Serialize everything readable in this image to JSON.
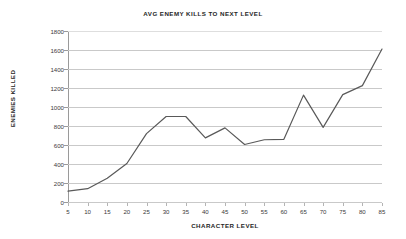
{
  "chart_data": {
    "type": "line",
    "title": "AVG ENEMY KILLS TO NEXT LEVEL",
    "xlabel": "CHARACTER LEVEL",
    "ylabel": "ENEMIES KILLED",
    "x": [
      5,
      10,
      15,
      20,
      25,
      30,
      35,
      40,
      45,
      50,
      55,
      60,
      65,
      70,
      75,
      80,
      85
    ],
    "categories": [
      "5",
      "10",
      "15",
      "20",
      "25",
      "30",
      "35",
      "40",
      "45",
      "50",
      "55",
      "60",
      "65",
      "70",
      "75",
      "80",
      "85"
    ],
    "values": [
      115,
      140,
      250,
      405,
      720,
      900,
      900,
      675,
      780,
      605,
      655,
      660,
      1125,
      785,
      1130,
      1225,
      1610
    ],
    "series": [
      {
        "name": "AVG ENEMY KILLS TO NEXT LEVEL",
        "values": [
          115,
          140,
          250,
          405,
          720,
          900,
          900,
          675,
          780,
          605,
          655,
          660,
          1125,
          785,
          1130,
          1225,
          1610
        ]
      }
    ],
    "xlim": [
      5,
      85
    ],
    "ylim": [
      0,
      1800
    ],
    "ytick_labels": [
      "1800",
      "1600",
      "1400",
      "1200",
      "1000",
      "800",
      "600",
      "400",
      "200",
      "0"
    ],
    "ytick_values": [
      1800,
      1600,
      1400,
      1200,
      1000,
      800,
      600,
      400,
      200,
      0
    ],
    "xtick_labels": [
      "5",
      "10",
      "15",
      "20",
      "25",
      "30",
      "35",
      "40",
      "45",
      "50",
      "55",
      "60",
      "65",
      "70",
      "75",
      "80",
      "85"
    ],
    "grid": "horizontal",
    "legend": "none",
    "line_color": "#595959",
    "grid_color": "#c9c9c9",
    "background": "#ffffff"
  }
}
